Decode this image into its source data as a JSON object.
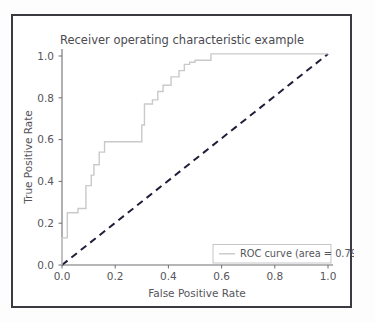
{
  "chart_data": {
    "type": "line",
    "title": "Receiver operating characteristic example",
    "xlabel": "False Positive Rate",
    "ylabel": "True Positive Rate",
    "xlim": [
      -0.02,
      1.02
    ],
    "ylim": [
      -0.02,
      1.06
    ],
    "grid": false,
    "legend_position": "lower right",
    "xticks": [
      "0.0",
      "0.2",
      "0.4",
      "0.6",
      "0.8",
      "1.0"
    ],
    "xtick_values": [
      0.0,
      0.2,
      0.4,
      0.6,
      0.8,
      1.0
    ],
    "yticks": [
      "0.0",
      "0.2",
      "0.4",
      "0.6",
      "0.8",
      "1.0"
    ],
    "ytick_values": [
      0.0,
      0.2,
      0.4,
      0.6,
      0.8,
      1.0
    ],
    "series": [
      {
        "name": "ROC curve (area = 0.79)",
        "style": "step",
        "color": "#c9c9cb",
        "linewidth": 1.4,
        "dash": "none",
        "area": 0.79,
        "x": [
          0.0,
          0.0,
          0.02,
          0.02,
          0.06,
          0.06,
          0.09,
          0.09,
          0.11,
          0.11,
          0.12,
          0.12,
          0.14,
          0.14,
          0.16,
          0.16,
          0.18,
          0.18,
          0.3,
          0.3,
          0.31,
          0.31,
          0.34,
          0.34,
          0.36,
          0.36,
          0.38,
          0.38,
          0.41,
          0.41,
          0.44,
          0.44,
          0.46,
          0.46,
          0.48,
          0.48,
          0.5,
          0.5,
          0.56,
          0.56,
          1.0
        ],
        "y": [
          0.0,
          0.13,
          0.13,
          0.25,
          0.25,
          0.27,
          0.27,
          0.38,
          0.38,
          0.43,
          0.43,
          0.48,
          0.48,
          0.54,
          0.54,
          0.59,
          0.59,
          0.59,
          0.59,
          0.67,
          0.67,
          0.77,
          0.77,
          0.79,
          0.79,
          0.83,
          0.83,
          0.86,
          0.86,
          0.9,
          0.9,
          0.93,
          0.93,
          0.96,
          0.96,
          0.97,
          0.97,
          0.98,
          0.98,
          1.01,
          1.01
        ]
      },
      {
        "name": "chance-diagonal",
        "style": "line",
        "color": "#1f1f3a",
        "linewidth": 2.0,
        "dash": "7 5",
        "x": [
          0.0,
          1.0
        ],
        "y": [
          0.0,
          1.01
        ]
      }
    ],
    "legend_entries": [
      {
        "label": "ROC curve (area = 0.79)",
        "color": "#c9c9cb",
        "dash": "none"
      }
    ]
  },
  "colors": {
    "frame": "#3a3a40",
    "axis": "#6f6f74",
    "roc_curve": "#c9c9cb",
    "diagonal": "#1f1f3a",
    "text": "#55555a",
    "background": "#ffffff"
  }
}
